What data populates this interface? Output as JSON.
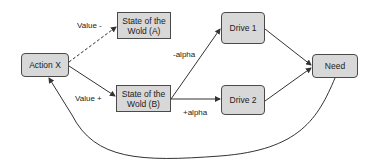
{
  "diagram": {
    "nodes": {
      "action_x": {
        "label": "Action X"
      },
      "state_a": {
        "label": "State of the Wold (A)"
      },
      "state_b": {
        "label": "State of the Wold (B)"
      },
      "drive_1": {
        "label": "Drive 1"
      },
      "drive_2": {
        "label": "Drive 2"
      },
      "need": {
        "label": "Need"
      }
    },
    "edges": {
      "action_to_a": {
        "label": "Value -",
        "style": "dashed"
      },
      "action_to_b": {
        "label": "Value +",
        "style": "solid"
      },
      "b_to_drive1": {
        "label": "-alpha"
      },
      "b_to_drive2": {
        "label": "+alpha"
      },
      "drive1_to_need": {
        "label": ""
      },
      "drive2_to_need": {
        "label": ""
      },
      "need_to_action": {
        "label": ""
      }
    },
    "colors": {
      "node_fill": "#d8d8d8",
      "stroke": "#333333"
    }
  }
}
